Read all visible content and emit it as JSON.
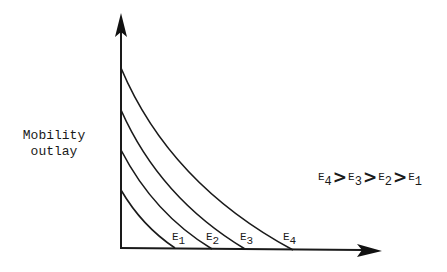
{
  "diagram": {
    "type": "indifference-style curve family",
    "y_axis_label": [
      "Mobility",
      "outlay"
    ],
    "x_axis_label": "",
    "curves": [
      {
        "name": "E1",
        "base": "E",
        "sub": "1",
        "y_intercept_px": 190,
        "x_intercept_px": 175
      },
      {
        "name": "E2",
        "base": "E",
        "sub": "2",
        "y_intercept_px": 150,
        "x_intercept_px": 212
      },
      {
        "name": "E3",
        "base": "E",
        "sub": "3",
        "y_intercept_px": 110,
        "x_intercept_px": 245
      },
      {
        "name": "E4",
        "base": "E",
        "sub": "4",
        "y_intercept_px": 68,
        "x_intercept_px": 293
      }
    ],
    "relation": {
      "terms": [
        {
          "base": "E",
          "sub": "4"
        },
        {
          "base": "E",
          "sub": "3"
        },
        {
          "base": "E",
          "sub": "2"
        },
        {
          "base": "E",
          "sub": "1"
        }
      ],
      "operator": ">",
      "text": "E4 > E3 > E2 > E1"
    },
    "colors": {
      "stroke": "#1a1a1a",
      "background": "#ffffff"
    }
  }
}
